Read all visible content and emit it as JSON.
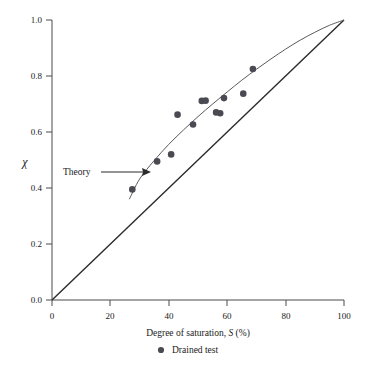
{
  "chart_data": {
    "type": "scatter",
    "title": "",
    "xlabel": "Degree of saturation, S (%)",
    "xlabel_parts": {
      "pre": "Degree of saturation, ",
      "italic": "S",
      "post": " (%)"
    },
    "ylabel": "χ",
    "xlim": [
      0,
      100
    ],
    "ylim": [
      0.0,
      1.0
    ],
    "xticks": [
      "0",
      "20",
      "40",
      "60",
      "80",
      "100"
    ],
    "xtick_values": [
      0,
      20,
      40,
      60,
      80,
      100
    ],
    "yticks": [
      "0.0",
      "0.2",
      "0.4",
      "0.6",
      "0.8",
      "1.0"
    ],
    "ytick_values": [
      0.0,
      0.2,
      0.4,
      0.6,
      0.8,
      1.0
    ],
    "grid": false,
    "legend_position": "below-axis",
    "legend": [
      {
        "label": "Drained test",
        "marker": "filled-circle",
        "color": "#4a4a52"
      }
    ],
    "annotations": [
      {
        "text": "Theory",
        "points_to": "theory-curve",
        "x": 31,
        "y": 0.46
      }
    ],
    "series": [
      {
        "name": "Drained test",
        "type": "scatter",
        "marker": "filled-circle",
        "color": "#4a4a52",
        "points": [
          {
            "x": 27.5,
            "y": 0.395
          },
          {
            "x": 36.0,
            "y": 0.495
          },
          {
            "x": 40.8,
            "y": 0.52
          },
          {
            "x": 43.0,
            "y": 0.662
          },
          {
            "x": 48.3,
            "y": 0.627
          },
          {
            "x": 51.3,
            "y": 0.711
          },
          {
            "x": 52.6,
            "y": 0.712
          },
          {
            "x": 56.2,
            "y": 0.67
          },
          {
            "x": 57.6,
            "y": 0.667
          },
          {
            "x": 58.9,
            "y": 0.721
          },
          {
            "x": 65.5,
            "y": 0.737
          },
          {
            "x": 68.8,
            "y": 0.825
          }
        ]
      },
      {
        "name": "Theory",
        "type": "line",
        "color": "#5a5a5a",
        "points": [
          {
            "x": 26.5,
            "y": 0.36
          },
          {
            "x": 30.0,
            "y": 0.432
          },
          {
            "x": 35.0,
            "y": 0.498
          },
          {
            "x": 40.0,
            "y": 0.556
          },
          {
            "x": 45.0,
            "y": 0.607
          },
          {
            "x": 50.0,
            "y": 0.655
          },
          {
            "x": 55.0,
            "y": 0.7
          },
          {
            "x": 60.0,
            "y": 0.743
          },
          {
            "x": 65.0,
            "y": 0.785
          },
          {
            "x": 70.0,
            "y": 0.824
          },
          {
            "x": 75.0,
            "y": 0.861
          },
          {
            "x": 80.0,
            "y": 0.896
          },
          {
            "x": 85.0,
            "y": 0.928
          },
          {
            "x": 90.0,
            "y": 0.956
          },
          {
            "x": 95.0,
            "y": 0.981
          },
          {
            "x": 100.0,
            "y": 1.0
          }
        ]
      },
      {
        "name": "1:1 line",
        "type": "line",
        "color": "#2b2b2b",
        "points": [
          {
            "x": 0,
            "y": 0.0
          },
          {
            "x": 100,
            "y": 1.0
          }
        ]
      }
    ]
  },
  "axes": {
    "x_title": "Degree of saturation, S (%)",
    "y_title": "χ"
  },
  "legend": {
    "entry_label": "Drained test",
    "marker_glyph": "●"
  },
  "annotation": {
    "theory_label": "Theory"
  },
  "colors": {
    "axis": "#4a4a4a",
    "point": "#4a4a52",
    "theory_curve": "#5a5a5a",
    "diagonal": "#2b2b2b",
    "background": "#ffffff"
  }
}
